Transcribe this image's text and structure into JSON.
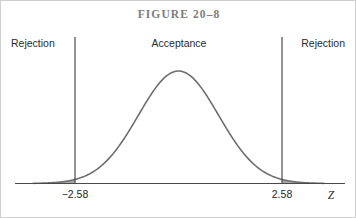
{
  "figure": {
    "title": "FIGURE 20–8",
    "labels": {
      "rejection_left": "Rejection",
      "acceptance": "Acceptance",
      "rejection_right": "Rejection"
    },
    "axis": {
      "variable": "Z",
      "tick_left": "−2.58",
      "tick_right": "2.58"
    },
    "colors": {
      "curve": "#6e6e6e",
      "shading": "#a8a8a8",
      "axis": "#4a4a4a",
      "title": "#7d7d7d",
      "text": "#1f1f1f",
      "frame": "#cfcfcf",
      "background": "#ffffff"
    }
  },
  "chart_data": {
    "type": "area",
    "title": "FIGURE 20–8",
    "xlabel": "Z",
    "ylabel": "",
    "distribution": "standard normal",
    "mean": 0,
    "sd": 1,
    "xlim": [
      -4.0,
      4.0
    ],
    "ylim": [
      0,
      0.4
    ],
    "grid": false,
    "legend": null,
    "critical_values": [
      -2.58,
      2.58
    ],
    "confidence_level": 0.99,
    "alpha": 0.01,
    "regions": [
      {
        "name": "Rejection",
        "from": -4.0,
        "to": -2.58,
        "shaded": true
      },
      {
        "name": "Acceptance",
        "from": -2.58,
        "to": 2.58,
        "shaded": false
      },
      {
        "name": "Rejection",
        "from": 2.58,
        "to": 4.0,
        "shaded": true
      }
    ],
    "x": [
      -4.0,
      -3.5,
      -3.0,
      -2.58,
      -2.5,
      -2.0,
      -1.5,
      -1.0,
      -0.5,
      0.0,
      0.5,
      1.0,
      1.5,
      2.0,
      2.5,
      2.58,
      3.0,
      3.5,
      4.0
    ],
    "y": [
      0.0001,
      0.0009,
      0.0044,
      0.0143,
      0.0175,
      0.054,
      0.1295,
      0.242,
      0.3521,
      0.3989,
      0.3521,
      0.242,
      0.1295,
      0.054,
      0.0175,
      0.0143,
      0.0044,
      0.0009,
      0.0001
    ],
    "tick_labels": [
      "−2.58",
      "2.58"
    ],
    "tick_positions": [
      -2.58,
      2.58
    ]
  }
}
